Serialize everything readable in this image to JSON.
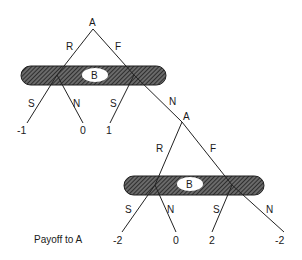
{
  "diagram": {
    "type": "extensive-form game tree",
    "payoff_caption": "Payoff to A",
    "colors": {
      "line": "#222222",
      "hatch": "#333333",
      "background": "#ffffff"
    },
    "nodes": {
      "root": {
        "label": "A"
      },
      "info_set_1": {
        "label": "B"
      },
      "second_A": {
        "label": "A"
      },
      "info_set_2": {
        "label": "B"
      }
    },
    "edges": {
      "root_R": "R",
      "root_F": "F",
      "b1_left_S": "S",
      "b1_left_N": "N",
      "b1_right_S": "S",
      "b1_right_N": "N",
      "a2_R": "R",
      "a2_F": "F",
      "b2_left_S": "S",
      "b2_left_N": "N",
      "b2_right_S": "S",
      "b2_right_N": "N"
    },
    "payoffs": [
      "-1",
      "0",
      "1",
      "-2",
      "0",
      "2",
      "-2"
    ]
  }
}
